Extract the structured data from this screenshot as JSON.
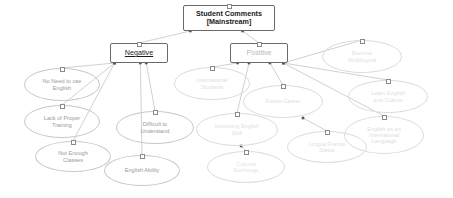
{
  "diagram": {
    "type": "concept-map",
    "canvas": {
      "width": 453,
      "height": 198,
      "background": "#ffffff"
    },
    "colors": {
      "root_text": "#1a1a1a",
      "negative_text": "#1a1a1a",
      "positive_text": "#b9b9b9",
      "negative_node_text": "#9a9a9a",
      "positive_node_text": "#dcdcdc",
      "box_border": "#6a6a6a",
      "oval_border": "#c9c9c9",
      "oval_border_dim": "#dcdcdc",
      "edge": "#b0b0b0"
    },
    "root": {
      "id": "root",
      "label": "Student Comments\n[Mainstream]",
      "shape": "rectangle",
      "x": 183,
      "y": 5,
      "w": 92,
      "h": 26,
      "font_size": 7.2,
      "font_weight": "bold",
      "color": "#1a1a1a"
    },
    "branches": [
      {
        "id": "negative",
        "label": "Negative",
        "shape": "rectangle",
        "x": 110,
        "y": 43,
        "w": 58,
        "h": 20,
        "font_size": 7.2,
        "underline": true,
        "color": "#1a1a1a"
      },
      {
        "id": "positive",
        "label": "Positive",
        "shape": "rectangle",
        "x": 230,
        "y": 43,
        "w": 58,
        "h": 20,
        "font_size": 7.2,
        "underline": false,
        "color": "#b9b9b9"
      }
    ],
    "leaves": [
      {
        "id": "no-need-english",
        "label": "No Need to use\nEnglish",
        "parent": "negative",
        "x": 24,
        "y": 68,
        "w": 76,
        "h": 33,
        "font_size": 5.6,
        "color": "#9a9a9a",
        "dim": false
      },
      {
        "id": "lack-proper-training",
        "label": "Lack of Proper\nTraining",
        "parent": "negative",
        "x": 24,
        "y": 105,
        "w": 76,
        "h": 33,
        "font_size": 5.6,
        "color": "#9a9a9a",
        "dim": false
      },
      {
        "id": "not-enough-classes",
        "label": "Not Enough\nClasses",
        "parent": "negative",
        "x": 35,
        "y": 141,
        "w": 76,
        "h": 31,
        "font_size": 5.6,
        "color": "#9a9a9a",
        "dim": false
      },
      {
        "id": "difficult-to-understand",
        "label": "Difficult to\nUnderstand",
        "parent": "negative",
        "x": 116,
        "y": 111,
        "w": 78,
        "h": 33,
        "font_size": 5.6,
        "color": "#9a9a9a",
        "dim": false
      },
      {
        "id": "english-ability",
        "label": "English Ability",
        "parent": "negative",
        "x": 104,
        "y": 155,
        "w": 76,
        "h": 31,
        "font_size": 5.6,
        "color": "#9a9a9a",
        "dim": false
      },
      {
        "id": "international-students",
        "label": "International\nStudents",
        "parent": "positive",
        "x": 174,
        "y": 67,
        "w": 76,
        "h": 33,
        "font_size": 5.6,
        "color": "#e0e0e0",
        "dim": true
      },
      {
        "id": "future-career",
        "label": "Future Career",
        "parent": "positive",
        "x": 243,
        "y": 85,
        "w": 80,
        "h": 33,
        "font_size": 5.6,
        "color": "#dcdcdc",
        "dim": true
      },
      {
        "id": "improving-english-skill",
        "label": "Improving English\nSkill",
        "parent": "positive",
        "x": 196,
        "y": 113,
        "w": 82,
        "h": 33,
        "font_size": 5.6,
        "color": "#e0e0e0",
        "dim": true
      },
      {
        "id": "cultural-exchange",
        "label": "Cultural\nExchange",
        "parent": "improving-english-skill",
        "x": 207,
        "y": 151,
        "w": 78,
        "h": 32,
        "font_size": 5.6,
        "color": "#e4e4e4",
        "dim": true
      },
      {
        "id": "lingua-franca-status",
        "label": "Lingua Franca\nStatus",
        "parent": "future-career",
        "x": 287,
        "y": 131,
        "w": 80,
        "h": 32,
        "font_size": 5.6,
        "color": "#dedede",
        "dim": true
      },
      {
        "id": "become-multilingual",
        "label": "Become\nMultilingual",
        "parent": "positive",
        "x": 322,
        "y": 40,
        "w": 80,
        "h": 33,
        "font_size": 5.6,
        "color": "#e2e2e2",
        "dim": true
      },
      {
        "id": "learn-english-and-culture",
        "label": "Learn English\nand Culture",
        "parent": "positive",
        "x": 348,
        "y": 80,
        "w": 80,
        "h": 33,
        "font_size": 5.6,
        "color": "#e0e0e0",
        "dim": true
      },
      {
        "id": "english-international-language",
        "label": "English as an\nInternational\nLanguage",
        "parent": "future-career",
        "x": 344,
        "y": 116,
        "w": 80,
        "h": 38,
        "font_size": 5.6,
        "color": "#dedede",
        "dim": true
      }
    ],
    "edges": [
      {
        "from": "root",
        "to": "negative"
      },
      {
        "from": "root",
        "to": "positive"
      },
      {
        "from": "negative",
        "to": "no-need-english"
      },
      {
        "from": "negative",
        "to": "lack-proper-training"
      },
      {
        "from": "negative",
        "to": "not-enough-classes"
      },
      {
        "from": "negative",
        "to": "difficult-to-understand"
      },
      {
        "from": "negative",
        "to": "english-ability"
      },
      {
        "from": "positive",
        "to": "international-students"
      },
      {
        "from": "positive",
        "to": "future-career"
      },
      {
        "from": "positive",
        "to": "improving-english-skill"
      },
      {
        "from": "positive",
        "to": "become-multilingual"
      },
      {
        "from": "positive",
        "to": "learn-english-and-culture"
      },
      {
        "from": "positive",
        "to": "english-international-language"
      },
      {
        "from": "future-career",
        "to": "lingua-franca-status"
      },
      {
        "from": "improving-english-skill",
        "to": "cultural-exchange"
      }
    ]
  }
}
